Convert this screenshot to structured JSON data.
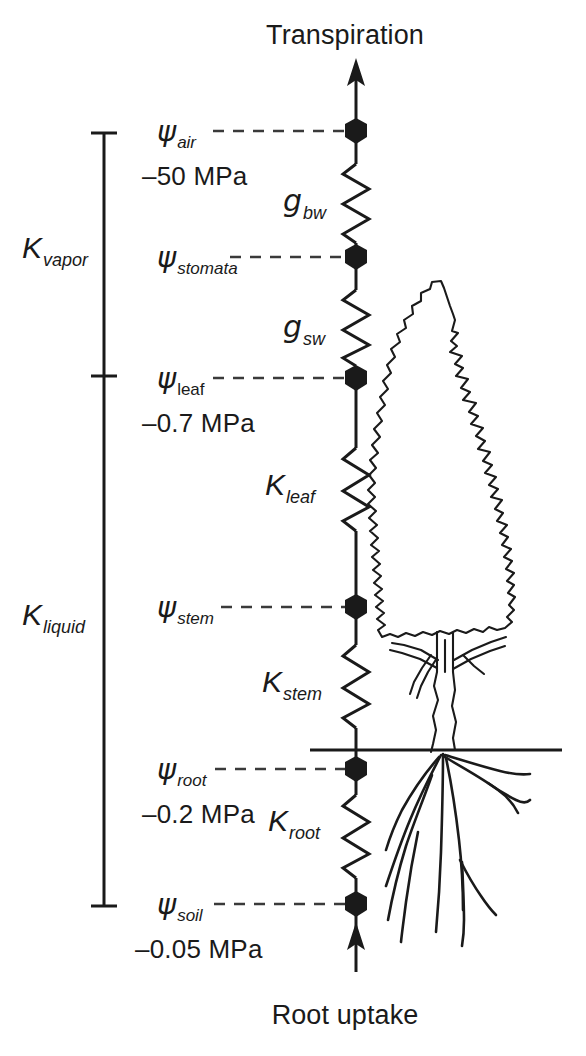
{
  "endpoints": {
    "top": "Transpiration",
    "bottom": "Root uptake"
  },
  "brackets": [
    {
      "symbol": "K",
      "subscript": "vapor",
      "name": "K-vapor"
    },
    {
      "symbol": "K",
      "subscript": "liquid",
      "name": "K-liquid"
    }
  ],
  "nodes": [
    {
      "symbol": "ψ",
      "subscript": "air",
      "subscript_style": "italic",
      "value": "–50 MPa",
      "name": "psi-air"
    },
    {
      "symbol": "ψ",
      "subscript": "stomata",
      "subscript_style": "italic",
      "value": "",
      "name": "psi-stomata"
    },
    {
      "symbol": "ψ",
      "subscript": "leaf",
      "subscript_style": "upright",
      "value": "–0.7 MPa",
      "name": "psi-leaf"
    },
    {
      "symbol": "ψ",
      "subscript": "stem",
      "subscript_style": "italic",
      "value": "",
      "name": "psi-stem"
    },
    {
      "symbol": "ψ",
      "subscript": "root",
      "subscript_style": "italic",
      "value": "–0.2 MPa",
      "name": "psi-root"
    },
    {
      "symbol": "ψ",
      "subscript": "soil",
      "subscript_style": "italic",
      "value": "–0.05 MPa",
      "name": "psi-soil"
    }
  ],
  "resistors": [
    {
      "symbol": "g",
      "subscript": "bw",
      "name": "g-bw"
    },
    {
      "symbol": "g",
      "subscript": "sw",
      "name": "g-sw"
    },
    {
      "symbol": "K",
      "subscript": "leaf",
      "name": "K-leaf"
    },
    {
      "symbol": "K",
      "subscript": "stem",
      "name": "K-stem"
    },
    {
      "symbol": "K",
      "subscript": "root",
      "name": "K-root"
    }
  ],
  "illustration": {
    "tree": "tree-outline",
    "roots": "root-system",
    "ground": "ground-line"
  },
  "colors": {
    "ink": "#1a1a1a",
    "background": "#ffffff",
    "dash": "#3a3a3a"
  }
}
